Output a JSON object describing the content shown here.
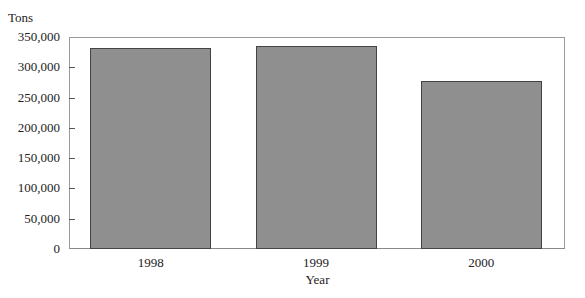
{
  "chart_data": {
    "type": "bar",
    "title": "",
    "xlabel": "Year",
    "ylabel": "Tons",
    "categories": [
      "1998",
      "1999",
      "2000"
    ],
    "values": [
      332000,
      335000,
      278000
    ],
    "ylim": [
      0,
      350000
    ],
    "yticks": [
      0,
      50000,
      100000,
      150000,
      200000,
      250000,
      300000,
      350000
    ],
    "ytick_labels": [
      "0",
      "50,000",
      "100,000",
      "150,000",
      "200,000",
      "250,000",
      "300,000",
      "350,000"
    ],
    "grid": false,
    "legend": null,
    "bar_color": "#8f8f8f"
  }
}
